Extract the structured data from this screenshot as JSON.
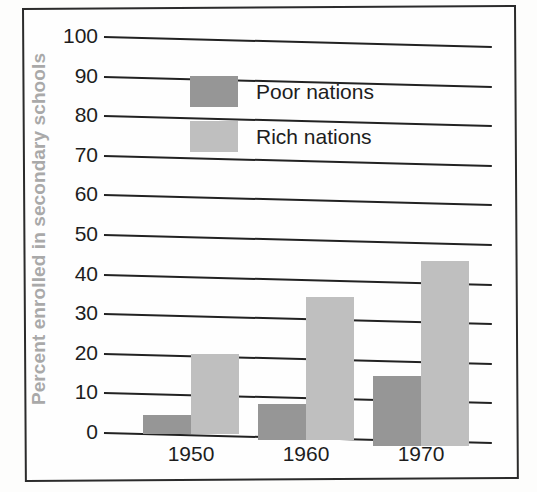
{
  "chart_data": {
    "type": "bar",
    "title": "",
    "subtitle": "",
    "xlabel": "",
    "ylabel": "Percent enrolled in secondary schools",
    "categories": [
      "1950",
      "1960",
      "1970"
    ],
    "series": [
      {
        "name": "Poor nations",
        "color": "#969696",
        "values": [
          4.5,
          8,
          16
        ]
      },
      {
        "name": "Rich nations",
        "color": "#bfbfbf",
        "values": [
          20,
          35,
          45
        ]
      }
    ],
    "ylim": [
      0,
      100
    ],
    "ytick_labels": [
      "0",
      "10",
      "20",
      "30",
      "40",
      "50",
      "60",
      "70",
      "80",
      "90",
      "100"
    ],
    "ytick_values": [
      0,
      10,
      20,
      30,
      40,
      50,
      60,
      70,
      80,
      90,
      100
    ],
    "grid": true,
    "legend_position": "top-center",
    "legend_entries": [
      "Poor nations",
      "Rich nations"
    ],
    "annotations": []
  }
}
